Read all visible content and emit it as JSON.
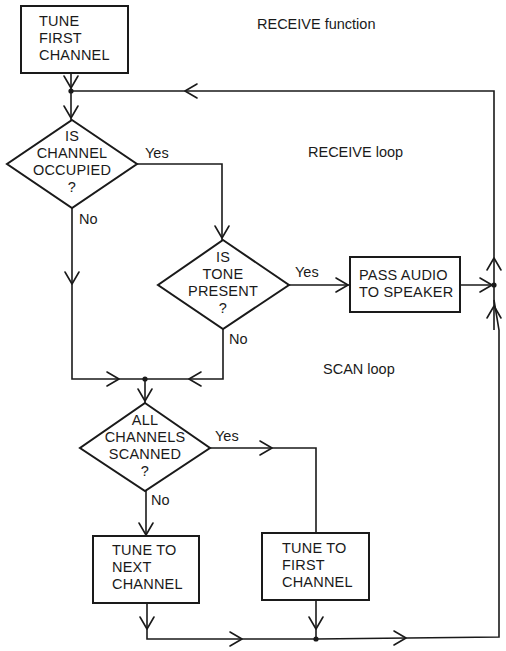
{
  "annotations": {
    "receive_function": "RECEIVE function",
    "receive_loop": "RECEIVE loop",
    "scan_loop": "SCAN loop"
  },
  "nodes": {
    "tune_first_channel_start": {
      "type": "process",
      "text": "TUNE\nFIRST\nCHANNEL"
    },
    "is_channel_occupied": {
      "type": "decision",
      "text": "IS\nCHANNEL\nOCCUPIED\n?"
    },
    "is_tone_present": {
      "type": "decision",
      "text": "IS\nTONE\nPRESENT\n?"
    },
    "pass_audio_to_speaker": {
      "type": "process",
      "text": "PASS AUDIO\nTO SPEAKER"
    },
    "all_channels_scanned": {
      "type": "decision",
      "text": "ALL\nCHANNELS\nSCANNED\n?"
    },
    "tune_to_next_channel": {
      "type": "process",
      "text": "TUNE TO\nNEXT\nCHANNEL"
    },
    "tune_to_first_channel": {
      "type": "process",
      "text": "TUNE TO\nFIRST\nCHANNEL"
    }
  },
  "edge_labels": {
    "occupied_yes": "Yes",
    "occupied_no": "No",
    "tone_yes": "Yes",
    "tone_no": "No",
    "scanned_yes": "Yes",
    "scanned_no": "No"
  },
  "edges": [
    {
      "from": "tune_first_channel_start",
      "to": "is_channel_occupied",
      "label": ""
    },
    {
      "from": "is_channel_occupied",
      "to": "is_tone_present",
      "label": "Yes"
    },
    {
      "from": "is_channel_occupied",
      "to": "all_channels_scanned",
      "label": "No"
    },
    {
      "from": "is_tone_present",
      "to": "pass_audio_to_speaker",
      "label": "Yes"
    },
    {
      "from": "is_tone_present",
      "to": "all_channels_scanned",
      "label": "No"
    },
    {
      "from": "pass_audio_to_speaker",
      "to": "is_channel_occupied",
      "label": ""
    },
    {
      "from": "all_channels_scanned",
      "to": "tune_to_first_channel",
      "label": "Yes"
    },
    {
      "from": "all_channels_scanned",
      "to": "tune_to_next_channel",
      "label": "No"
    },
    {
      "from": "tune_to_next_channel",
      "to": "is_channel_occupied",
      "label": ""
    },
    {
      "from": "tune_to_first_channel",
      "to": "is_channel_occupied",
      "label": ""
    }
  ]
}
